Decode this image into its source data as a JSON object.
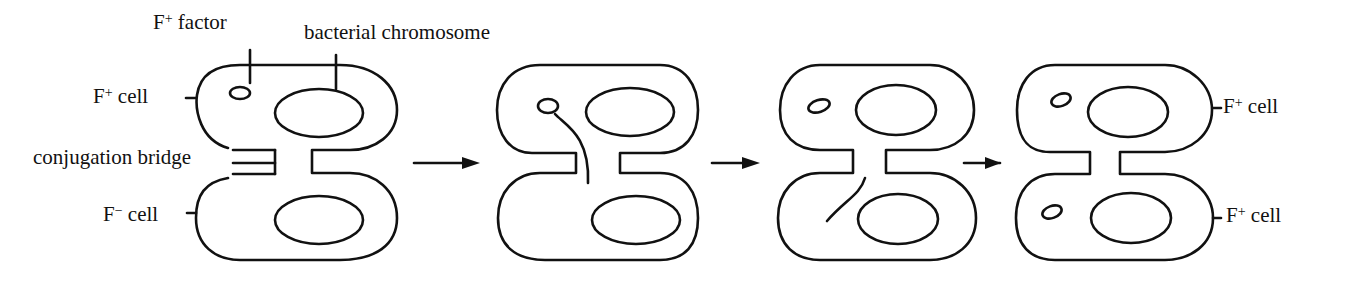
{
  "labels": {
    "f_factor_prefix": "F",
    "f_factor_sup": "+",
    "f_factor_suffix": " factor",
    "chromosome": "bacterial chromosome",
    "fplus_cell_prefix": "F",
    "fplus_cell_sup": "+",
    "fplus_cell_suffix": " cell",
    "fminus_cell_prefix": "F",
    "fminus_cell_sup": "−",
    "fminus_cell_suffix": " cell",
    "bridge": "conjugation bridge",
    "right_top_prefix": "F",
    "right_top_sup": "+",
    "right_top_suffix": " cell",
    "right_bottom_prefix": "F",
    "right_bottom_sup": "+",
    "right_bottom_suffix": " cell"
  },
  "stages": [
    {
      "id": 1,
      "description": "F+ cell connected to F- cell by conjugation bridge"
    },
    {
      "id": 2,
      "description": "F factor strand moves through bridge"
    },
    {
      "id": 3,
      "description": "F factor strand enters F- cell"
    },
    {
      "id": 4,
      "description": "Both cells become F+ cells"
    }
  ],
  "arrows": 3
}
